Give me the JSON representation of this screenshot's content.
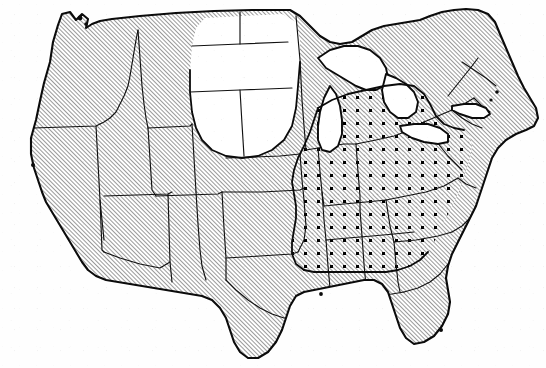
{
  "figure": {
    "kind": "thematic-map",
    "region": "Contiguous United States",
    "title": "",
    "caption": "",
    "background_color": "#fefefe",
    "ink_color": "#0b0b0b",
    "border_color": "#111111"
  },
  "legend": {
    "shown": false,
    "entries": [
      {
        "key": "hatched",
        "pattern": "diagonal-hatch",
        "label": ""
      },
      {
        "key": "hatched_dotted",
        "pattern": "diagonal-hatch-with-dots",
        "label": ""
      },
      {
        "key": "unshaded",
        "pattern": "blank",
        "label": ""
      }
    ]
  },
  "patterns": {
    "hatch": {
      "angle_deg": 45,
      "spacing_px": 3,
      "stroke_width_px": 0.85,
      "color": "#111111"
    },
    "dots": {
      "spacing_px": 13,
      "marker": "square",
      "size_px": 3,
      "color": "#000000"
    },
    "blank": {
      "color": "#ffffff"
    }
  },
  "zones": {
    "hatched_only": [
      "Washington",
      "Oregon",
      "California",
      "Idaho",
      "Nevada",
      "Utah",
      "Arizona",
      "New Mexico",
      "Colorado",
      "Texas",
      "Oklahoma",
      "Kansas",
      "Minnesota",
      "Iowa",
      "Wisconsin",
      "Missouri",
      "Louisiana",
      "Maine",
      "New Hampshire",
      "Vermont",
      "Massachusetts",
      "Connecticut",
      "Rhode Island",
      "New York",
      "Pennsylvania",
      "New Jersey",
      "Florida peninsula"
    ],
    "hatched_with_dots": [
      "Michigan",
      "Illinois",
      "Indiana",
      "Ohio",
      "Kentucky",
      "Tennessee",
      "West Virginia",
      "Virginia",
      "North Carolina",
      "South Carolina",
      "Georgia",
      "Alabama",
      "Mississippi",
      "Arkansas",
      "Maryland",
      "Delaware"
    ],
    "unshaded": [
      "Montana",
      "North Dakota",
      "South Dakota",
      "Wyoming",
      "Nebraska"
    ],
    "water_unshaded": [
      "Lake Superior",
      "Lake Michigan",
      "Lake Huron",
      "Lake Erie",
      "Lake Ontario"
    ]
  },
  "labels": {
    "state_labels_shown": false,
    "city_labels_shown": false
  },
  "axes": {
    "shown": false
  },
  "frame": {
    "shown": false
  }
}
